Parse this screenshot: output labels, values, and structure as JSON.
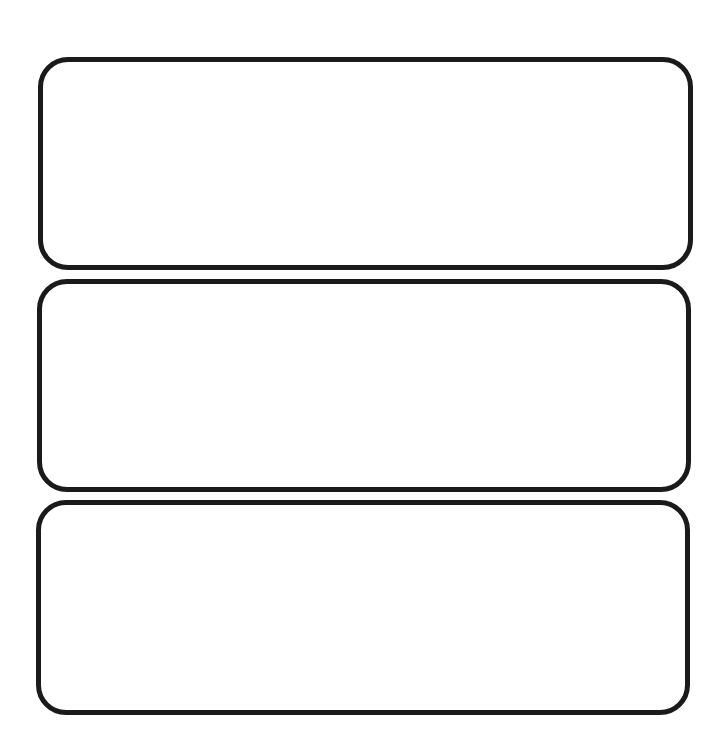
{
  "page": {
    "background": "#ffffff",
    "border_color": "#1a1a1a"
  },
  "boxes": [
    {
      "id": 1,
      "content": ""
    },
    {
      "id": 2,
      "content": ""
    },
    {
      "id": 3,
      "content": ""
    }
  ]
}
